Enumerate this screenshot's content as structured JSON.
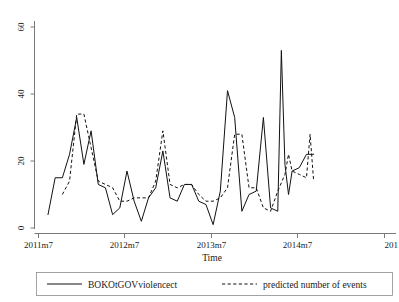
{
  "chart_data": {
    "type": "line",
    "title": "",
    "xlabel": "Time",
    "ylabel": "",
    "grid": false,
    "legend_position": "bottom",
    "ylim": [
      0,
      62
    ],
    "yticks": [
      0,
      20,
      40,
      60
    ],
    "ytick_labels": [
      "0",
      "20",
      "40",
      "60"
    ],
    "xtick_labels": [
      "2011m7",
      "2012m7",
      "2013m7",
      "2014m7",
      "201"
    ],
    "xtick_values": [
      "2011m7",
      "2012m7",
      "2013m7",
      "2014m7",
      "2015m7"
    ],
    "x_axis_note": "monthly observations, last x tick label is clipped at the right edge",
    "x": [
      "2011m8",
      "2011m9",
      "2011m10",
      "2011m11",
      "2011m12",
      "2012m1",
      "2012m2",
      "2012m3",
      "2012m4",
      "2012m5",
      "2012m6",
      "2012m7",
      "2012m8",
      "2012m9",
      "2012m10",
      "2012m11",
      "2012m12",
      "2013m1",
      "2013m2",
      "2013m3",
      "2013m4",
      "2013m5",
      "2013m6",
      "2013m7",
      "2013m8",
      "2013m9",
      "2013m10",
      "2013m11",
      "2013m12",
      "2014m1",
      "2014m2",
      "2014m3",
      "2014m4",
      "2014m5",
      "2014m6",
      "2014m7",
      "2014m8",
      "2014m9"
    ],
    "series": [
      {
        "name": "BOKOtGOVviolencect",
        "style": "solid",
        "values": [
          4,
          15,
          15,
          22,
          33,
          19,
          29,
          13,
          12,
          4,
          6,
          17,
          8,
          2,
          9,
          12,
          23,
          9,
          8,
          13,
          13,
          8,
          7,
          1,
          11,
          41,
          33,
          5,
          10,
          11,
          33,
          6,
          5,
          19,
          17,
          18,
          22,
          22
        ]
      },
      {
        "name": "predicted number of events",
        "style": "dashed",
        "values": [
          null,
          null,
          10,
          14,
          34,
          34,
          24,
          14,
          13,
          12,
          8,
          8,
          9,
          9,
          9,
          14,
          29,
          13,
          12,
          13,
          13,
          10,
          8,
          8,
          9,
          12,
          28,
          28,
          12,
          12,
          6,
          5,
          11,
          16,
          17,
          16,
          15,
          14
        ]
      }
    ],
    "observed_extra_points": [
      {
        "x": "2014m4",
        "y": 53
      },
      {
        "x": "2014m5",
        "y": 10
      }
    ],
    "predicted_extra_points": [
      {
        "x": "2014m5",
        "y": 22
      },
      {
        "x": "2014m8",
        "y": 28
      }
    ]
  },
  "axes": {
    "y_tick_labels": [
      "60",
      "40",
      "20",
      "0"
    ],
    "x_tick_labels": [
      "2011m7",
      "2012m7",
      "2013m7",
      "2014m7",
      "201"
    ],
    "x_axis_title": "Time"
  },
  "legend": {
    "entries": [
      {
        "label": "BOKOtGOVviolencect",
        "style": "solid"
      },
      {
        "label": "predicted number of events",
        "style": "dashed"
      }
    ]
  }
}
